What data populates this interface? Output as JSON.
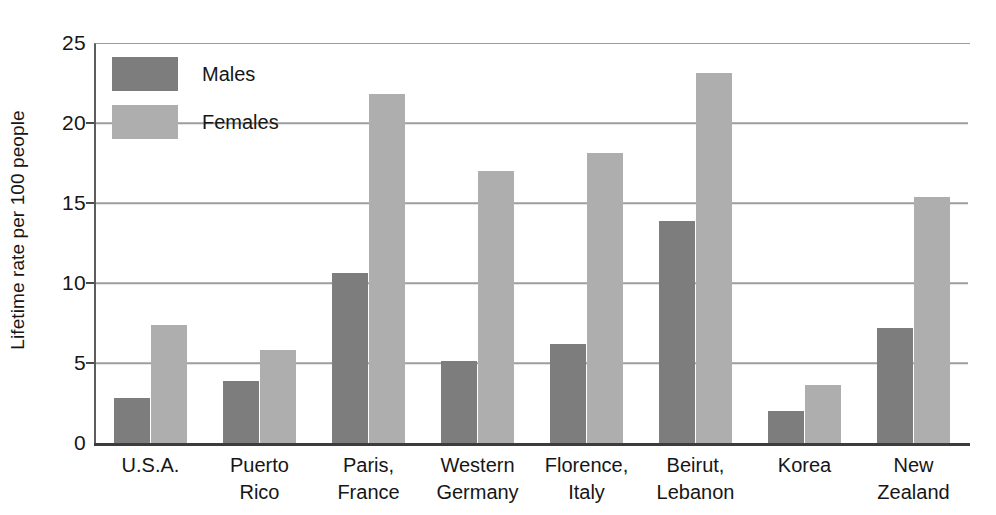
{
  "chart_data": {
    "type": "bar",
    "title": "",
    "xlabel": "",
    "ylabel": "Lifetime rate per 100 people",
    "ylim": [
      0,
      25
    ],
    "yticks": [
      0,
      5,
      10,
      15,
      20,
      25
    ],
    "grid": true,
    "legend_position": "top-left",
    "categories": [
      "U.S.A.",
      "Puerto Rico",
      "Paris, France",
      "Western Germany",
      "Florence, Italy",
      "Beirut, Lebanon",
      "Korea",
      "New Zealand"
    ],
    "category_lines": [
      [
        "U.S.A.",
        ""
      ],
      [
        "Puerto",
        "Rico"
      ],
      [
        "Paris,",
        "France"
      ],
      [
        "Western",
        "Germany"
      ],
      [
        "Florence,",
        "Italy"
      ],
      [
        "Beirut,",
        "Lebanon"
      ],
      [
        "Korea",
        ""
      ],
      [
        "New",
        "Zealand"
      ]
    ],
    "series": [
      {
        "name": "Males",
        "color": "#7d7d7d",
        "values": [
          2.8,
          3.9,
          10.6,
          5.1,
          6.2,
          13.9,
          2.0,
          7.2
        ]
      },
      {
        "name": "Females",
        "color": "#aeaeae",
        "values": [
          7.4,
          5.8,
          21.8,
          17.0,
          18.1,
          23.1,
          3.6,
          15.4
        ]
      }
    ]
  },
  "axis": {
    "tick_labels": [
      "25",
      "20",
      "15",
      "10",
      "5",
      "0"
    ]
  },
  "legend": {
    "items": [
      {
        "label": "Males",
        "color": "#7d7d7d"
      },
      {
        "label": "Females",
        "color": "#aeaeae"
      }
    ]
  }
}
